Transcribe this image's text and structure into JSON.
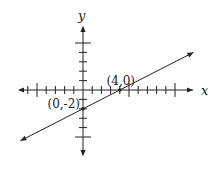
{
  "chart_data": {
    "type": "line",
    "title": "",
    "xlabel": "x",
    "ylabel": "y",
    "xlim": [
      -7,
      11
    ],
    "ylim": [
      -6.5,
      6.5
    ],
    "x_ticks": [
      -6,
      -5,
      -4,
      -3,
      -2,
      -1,
      1,
      2,
      3,
      4,
      5,
      6,
      7,
      8,
      9,
      10
    ],
    "x_major_ticks": [
      -5,
      5,
      10
    ],
    "y_ticks": [
      -5,
      -4,
      -3,
      -2,
      -1,
      1,
      2,
      3,
      4,
      5
    ],
    "y_major_ticks": [
      -5,
      5
    ],
    "series": [
      {
        "name": "line",
        "slope": 0.5,
        "intercept": -2,
        "x_range": [
          -6.8,
          12
        ]
      }
    ],
    "points": [
      {
        "label": "(4,0)",
        "x": 4,
        "y": 0
      },
      {
        "label": "(0,-2)",
        "x": 0,
        "y": -2
      }
    ],
    "grid": false
  },
  "colors": {
    "ink": "#222222"
  }
}
